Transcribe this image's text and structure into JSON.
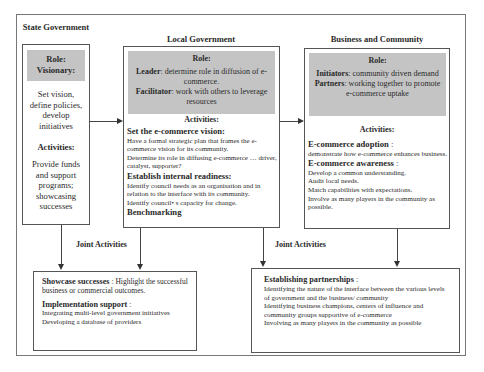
{
  "columns": {
    "state": {
      "title": "State Government",
      "role_heading": "Role:",
      "role_name": "Visionary:",
      "role_text": "Set vision, define policies, develop initiatives",
      "activities_heading": "Activities:",
      "activities_text": "Provide funds and support programs; showcasing successes"
    },
    "local": {
      "title": "Local Government",
      "role_heading": "Role:",
      "roles": [
        {
          "name": "Leader",
          "text": ": determine role in diffusion of  e-commerce."
        },
        {
          "name": "Facilitator",
          "text": ": work with others to leverage resources"
        }
      ],
      "activities_heading": "Activities:",
      "sections": [
        {
          "heading": "Set the e-commerce vision:",
          "lines": [
            "Have a formal strategic plan that frames the e-commerce vision for its community.",
            "Determine its role in diffusing e-commerce … driver, catalyst, supporter?"
          ]
        },
        {
          "heading": "Establish internal readiness:",
          "lines": [
            "Identify council needs as an organisation and in relation to the interface with its community.",
            "Identify council• s capacity for change."
          ]
        },
        {
          "heading": "Benchmarking",
          "lines": []
        }
      ]
    },
    "business": {
      "title": "Business and Community",
      "role_heading": "Role:",
      "roles": [
        {
          "name": "Initiators",
          "text": ": community driven demand"
        },
        {
          "name": "Partners",
          "text": ": working together to promote e-commerce uptake"
        }
      ],
      "activities_heading": "Activities:",
      "sections": [
        {
          "heading": "E-commerce adoption",
          "suffix": " :",
          "lines": [
            "demonstrate how e-commerce enhances business."
          ]
        },
        {
          "heading": "E-commerce awareness",
          "suffix": " :",
          "lines": [
            "Develop a common understanding.",
            "Audit local needs.",
            "Match capabilities with expectations.",
            "Involve as many players in the community as possible."
          ]
        }
      ]
    }
  },
  "joint": {
    "left_label": "Joint Activities",
    "right_label": "Joint Activities",
    "left_box": {
      "s1_heading": "Showcase successes",
      "s1_text": " :  Highlight the successful business or commercial outcomes.",
      "s2_heading": "Implementation support",
      "s2_suffix": " :",
      "s2_lines": [
        "Integrating multi-level government initiatives",
        "Developing a database of providers"
      ]
    },
    "right_box": {
      "heading": "Establishing partnerships",
      "suffix": " :",
      "lines": [
        "Identifying the nature of the interface between the various levels of government and the business/ community",
        "Identifying business champions, centers of influence and community groups supportive of e-commerce",
        "Involving as many players in the community as possible"
      ]
    }
  },
  "colors": {
    "role_band": "#c4c4c4",
    "border": "#555555",
    "frame": "#777777"
  }
}
